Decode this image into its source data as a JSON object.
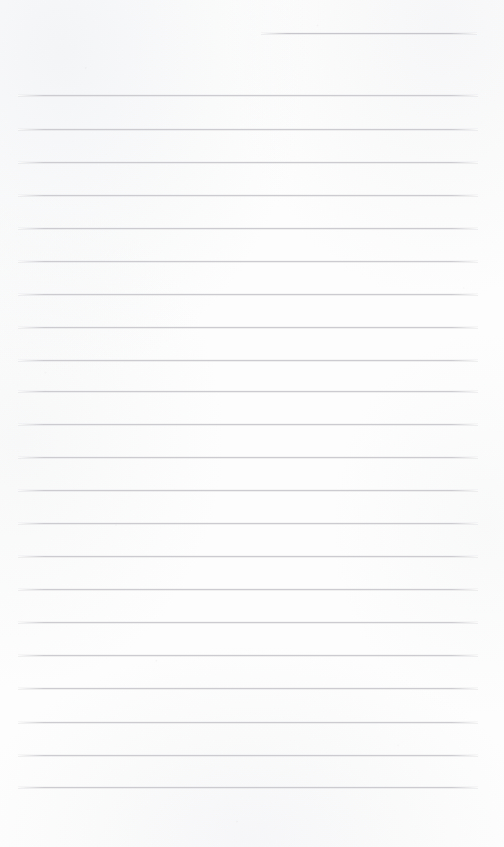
{
  "document": {
    "kind": "lined-paper-scan",
    "title": "",
    "page_width": 504,
    "page_height": 847,
    "background_color": "#fdfdfd",
    "rule_color": "#c9c9ce",
    "rule_thickness_px": 1,
    "has_text": false,
    "written_content": [],
    "margin_left_px": 18,
    "margin_right_px": 26,
    "rule_spacing_px": 33.3,
    "bottom_blank_space_px": 60
  },
  "ruled_lines": [
    {
      "id": "rule-partial-top",
      "y": 33,
      "x_start": 261,
      "x_end": 477,
      "full_width": false,
      "text": ""
    },
    {
      "id": "rule-1",
      "y": 95,
      "x_start": 18,
      "x_end": 478,
      "full_width": true,
      "text": ""
    },
    {
      "id": "rule-2",
      "y": 129,
      "x_start": 18,
      "x_end": 478,
      "full_width": true,
      "text": ""
    },
    {
      "id": "rule-3",
      "y": 162,
      "x_start": 18,
      "x_end": 478,
      "full_width": true,
      "text": ""
    },
    {
      "id": "rule-4",
      "y": 195,
      "x_start": 18,
      "x_end": 478,
      "full_width": true,
      "text": ""
    },
    {
      "id": "rule-5",
      "y": 228,
      "x_start": 18,
      "x_end": 478,
      "full_width": true,
      "text": ""
    },
    {
      "id": "rule-6",
      "y": 261,
      "x_start": 18,
      "x_end": 478,
      "full_width": true,
      "text": ""
    },
    {
      "id": "rule-7",
      "y": 294,
      "x_start": 18,
      "x_end": 478,
      "full_width": true,
      "text": ""
    },
    {
      "id": "rule-8",
      "y": 327,
      "x_start": 18,
      "x_end": 478,
      "full_width": true,
      "text": ""
    },
    {
      "id": "rule-9",
      "y": 360,
      "x_start": 18,
      "x_end": 478,
      "full_width": true,
      "text": ""
    },
    {
      "id": "rule-10",
      "y": 391,
      "x_start": 18,
      "x_end": 478,
      "full_width": true,
      "text": ""
    },
    {
      "id": "rule-11",
      "y": 424,
      "x_start": 18,
      "x_end": 478,
      "full_width": true,
      "text": ""
    },
    {
      "id": "rule-12",
      "y": 457,
      "x_start": 18,
      "x_end": 478,
      "full_width": true,
      "text": ""
    },
    {
      "id": "rule-13",
      "y": 490,
      "x_start": 18,
      "x_end": 478,
      "full_width": true,
      "text": ""
    },
    {
      "id": "rule-14",
      "y": 523,
      "x_start": 18,
      "x_end": 478,
      "full_width": true,
      "text": ""
    },
    {
      "id": "rule-15",
      "y": 556,
      "x_start": 18,
      "x_end": 478,
      "full_width": true,
      "text": ""
    },
    {
      "id": "rule-16",
      "y": 589,
      "x_start": 18,
      "x_end": 478,
      "full_width": true,
      "text": ""
    },
    {
      "id": "rule-17",
      "y": 622,
      "x_start": 18,
      "x_end": 478,
      "full_width": true,
      "text": ""
    },
    {
      "id": "rule-18",
      "y": 655,
      "x_start": 18,
      "x_end": 478,
      "full_width": true,
      "text": ""
    },
    {
      "id": "rule-19",
      "y": 688,
      "x_start": 18,
      "x_end": 478,
      "full_width": true,
      "text": ""
    },
    {
      "id": "rule-20",
      "y": 722,
      "x_start": 18,
      "x_end": 478,
      "full_width": true,
      "text": ""
    },
    {
      "id": "rule-21",
      "y": 755,
      "x_start": 18,
      "x_end": 478,
      "full_width": true,
      "text": ""
    },
    {
      "id": "rule-22",
      "y": 787,
      "x_start": 18,
      "x_end": 478,
      "full_width": true,
      "text": ""
    }
  ]
}
